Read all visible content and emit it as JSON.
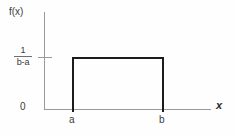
{
  "chart_data": {
    "type": "area",
    "title": "",
    "subtitle": "",
    "xlabel": "x",
    "ylabel": "f(x)",
    "xlim": [
      "a",
      "b"
    ],
    "ylim": [
      0,
      "1/(b-a)"
    ],
    "grid": false,
    "legend": null,
    "x_tick_labels": [
      "a",
      "b"
    ],
    "y_tick_labels": [
      "0",
      "1/(b-a)"
    ],
    "series": [
      {
        "name": "f(x)",
        "x": [
          "a",
          "a",
          "b",
          "b"
        ],
        "values": [
          0,
          "1/(b-a)",
          "1/(b-a)",
          0
        ]
      }
    ],
    "height_numerator": "1",
    "height_denominator": "b-a",
    "origin_label": "0",
    "colors": {
      "curve": "#1c1c1c",
      "axis": "#9a9a9a",
      "text": "#3a3a3a",
      "background": "#fefefe"
    }
  },
  "axes": {
    "y_axis_label": "f(x)",
    "x_axis_label": "x",
    "origin": "0"
  },
  "ticks": {
    "x": [
      {
        "label": "a"
      },
      {
        "label": "b"
      }
    ],
    "y": [
      {
        "label": "0"
      },
      {
        "numerator": "1",
        "denominator": "b-a"
      }
    ]
  }
}
